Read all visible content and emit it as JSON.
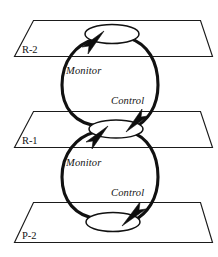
{
  "diagram": {
    "background_color": "#ffffff",
    "line_color": "#111111",
    "text_color": "#141414",
    "planes": [
      {
        "id": "plane-r2",
        "label": "R-2"
      },
      {
        "id": "plane-r1",
        "label": "R-1"
      },
      {
        "id": "plane-p2",
        "label": "P-2"
      }
    ],
    "loops": [
      {
        "id": "loop-upper",
        "monitor_label": "Monitor",
        "control_label": "Control",
        "from_plane": "R-1",
        "to_plane": "R-2"
      },
      {
        "id": "loop-lower",
        "monitor_label": "Monitor",
        "control_label": "Control",
        "from_plane": "P-2",
        "to_plane": "R-1"
      }
    ],
    "nodes": [
      {
        "id": "node-top",
        "shape": "ellipse",
        "on_plane": "R-2"
      },
      {
        "id": "node-middle",
        "shape": "ellipse",
        "on_plane": "R-1"
      },
      {
        "id": "node-bottom",
        "shape": "ellipse",
        "on_plane": "P-2"
      }
    ]
  }
}
